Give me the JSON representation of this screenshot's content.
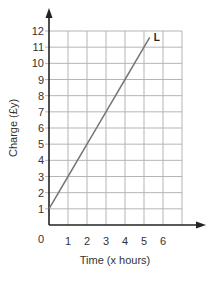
{
  "chart_data": {
    "type": "line",
    "title": "",
    "xlabel": "Time (x hours)",
    "ylabel": "Charge (£y)",
    "x_ticks": [
      "1",
      "2",
      "3",
      "4",
      "5",
      "6"
    ],
    "y_ticks": [
      "1",
      "2",
      "3",
      "4",
      "5",
      "6",
      "7",
      "8",
      "9",
      "10",
      "11",
      "12"
    ],
    "origin_label": "0",
    "xlim": [
      0,
      7
    ],
    "ylim": [
      0,
      12
    ],
    "grid": true,
    "series": [
      {
        "name": "L",
        "x": [
          0,
          1,
          2,
          3,
          4,
          5,
          5.3
        ],
        "y": [
          1,
          3,
          5,
          7,
          9,
          11,
          11.6
        ],
        "equation": "y = 2x + 1"
      }
    ],
    "colors": {
      "line": "#777777",
      "grid": "#b5b5b5",
      "axis": "#222222"
    }
  }
}
